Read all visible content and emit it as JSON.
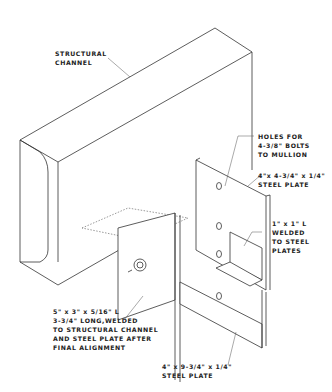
{
  "drawing": {
    "subject": "Mullion anchor connection to structural channel",
    "labels": {
      "structural_channel": [
        "STRUCTURAL",
        "CHANNEL"
      ],
      "holes": [
        "HOLES FOR",
        "4-3/8\" BOLTS",
        "TO MULLION"
      ],
      "upper_plate": [
        "4\"x 4-3/4\" x 1/4\"",
        "STEEL PLATE"
      ],
      "small_angle": [
        "1\" x 1\" L",
        "WELDED",
        "TO STEEL",
        "PLATES"
      ],
      "large_angle": [
        "5\" x 3\" x 5/16\" L",
        "3-3/4\" LONG,WELDED",
        "TO STRUCTURAL CHANNEL",
        "AND STEEL PLATE AFTER",
        "FINAL ALIGNMENT"
      ],
      "lower_plate": [
        "4\" x 9-3/4\" x 1/4\"",
        "STEEL PLATE"
      ]
    }
  }
}
